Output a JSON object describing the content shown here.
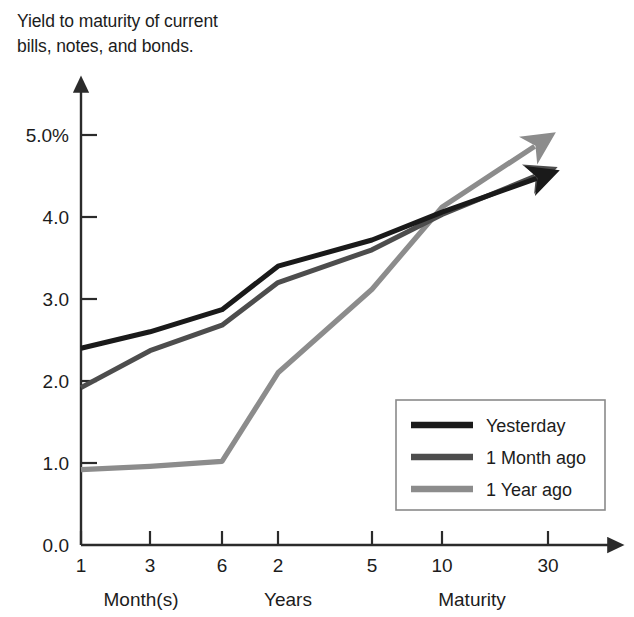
{
  "title": "Yield to maturity of current\nbills, notes, and bonds.",
  "chart_data": {
    "type": "line",
    "title": "Yield to maturity of current bills, notes, and bonds.",
    "xlabel": "Maturity",
    "ylabel": "",
    "grid": false,
    "legend_position": "inside-bottom-right",
    "ylim": [
      0.0,
      5.0
    ],
    "ytick_labels": [
      "5.0%",
      "4.0",
      "3.0",
      "2.0",
      "1.0",
      "0.0"
    ],
    "yticks": [
      5.0,
      4.0,
      3.0,
      2.0,
      1.0,
      0.0
    ],
    "categories": [
      "1",
      "3",
      "6",
      "2",
      "5",
      "10",
      "30"
    ],
    "category_groups": [
      {
        "label": "Month(s)",
        "members": [
          "1",
          "3",
          "6"
        ]
      },
      {
        "label": "Years",
        "members": [
          "2",
          "5",
          "10",
          "30"
        ]
      }
    ],
    "series": [
      {
        "name": "Yesterday",
        "color": "#1a1a1a",
        "values": [
          2.4,
          2.6,
          2.87,
          3.4,
          3.72,
          4.06,
          4.52
        ]
      },
      {
        "name": "1 Month ago",
        "color": "#4d4d4d",
        "values": [
          1.92,
          2.37,
          2.68,
          3.2,
          3.6,
          4.03,
          4.56
        ]
      },
      {
        "name": "1 Year ago",
        "color": "#8c8c8c",
        "values": [
          0.92,
          0.96,
          1.02,
          2.1,
          3.12,
          4.12,
          4.97
        ]
      }
    ]
  },
  "axes": {
    "y_ticks": [
      {
        "label": "5.0%"
      },
      {
        "label": "4.0"
      },
      {
        "label": "3.0"
      },
      {
        "label": "2.0"
      },
      {
        "label": "1.0"
      },
      {
        "label": "0.0"
      }
    ],
    "x_ticks": [
      {
        "label": "1"
      },
      {
        "label": "3"
      },
      {
        "label": "6"
      },
      {
        "label": "2"
      },
      {
        "label": "5"
      },
      {
        "label": "10"
      },
      {
        "label": "30"
      }
    ],
    "x_group_labels": [
      {
        "label": "Month(s)"
      },
      {
        "label": "Years"
      },
      {
        "label": "Maturity"
      }
    ]
  },
  "legend": {
    "items": [
      {
        "label": "Yesterday",
        "color": "#1a1a1a"
      },
      {
        "label": "1 Month ago",
        "color": "#4d4d4d"
      },
      {
        "label": "1 Year ago",
        "color": "#8c8c8c"
      }
    ]
  }
}
